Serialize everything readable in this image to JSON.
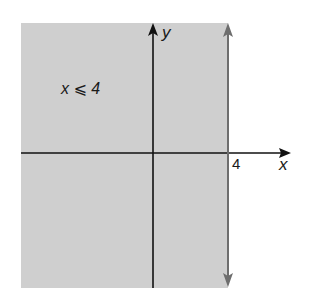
{
  "graph": {
    "inequality_label": "x ⩽ 4",
    "x_axis_label": "x",
    "y_axis_label": "y",
    "boundary_tick_label": "4",
    "boundary_value": 4,
    "boundary_type": "vertical line x = 4 (solid, included)",
    "shaded_region": "x ≤ 4 (left of boundary)"
  },
  "colors": {
    "shade": "#cfcfcf",
    "axes": "#111111",
    "boundary": "#6e6e6e",
    "background": "#ffffff"
  }
}
